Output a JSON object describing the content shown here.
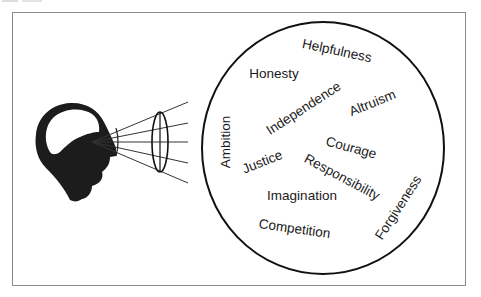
{
  "figure": {
    "colors": {
      "frame": "#8a8a8a",
      "ink": "#111111",
      "head_fill": "#1c1c1c",
      "text": "#1a1a1a"
    },
    "head": {
      "label": "head-silhouette",
      "eye_point": [
        92,
        142
      ]
    },
    "lens": {
      "center": [
        160,
        142
      ],
      "rx": 8,
      "ry": 30
    },
    "rays": [
      {
        "end": [
          188,
          102
        ]
      },
      {
        "end": [
          188,
          123
        ]
      },
      {
        "end": [
          188,
          142
        ]
      },
      {
        "end": [
          188,
          163
        ]
      },
      {
        "end": [
          188,
          183
        ]
      }
    ],
    "circle": {
      "center": [
        323,
        148
      ],
      "rx": 121,
      "ry": 126
    },
    "values": [
      {
        "label": "Helpfulness",
        "x": 336,
        "y": 55,
        "rotate": 12
      },
      {
        "label": "Honesty",
        "x": 274,
        "y": 78,
        "rotate": 0
      },
      {
        "label": "Independence",
        "x": 306,
        "y": 112,
        "rotate": -33
      },
      {
        "label": "Altruism",
        "x": 374,
        "y": 107,
        "rotate": -22
      },
      {
        "label": "Ambition",
        "x": 230,
        "y": 142,
        "rotate": -90
      },
      {
        "label": "Courage",
        "x": 350,
        "y": 152,
        "rotate": 15
      },
      {
        "label": "Justice",
        "x": 264,
        "y": 166,
        "rotate": -22
      },
      {
        "label": "Responsibility",
        "x": 340,
        "y": 181,
        "rotate": 28
      },
      {
        "label": "Imagination",
        "x": 302,
        "y": 200,
        "rotate": 0
      },
      {
        "label": "Competition",
        "x": 294,
        "y": 233,
        "rotate": 8
      },
      {
        "label": "Forgiveness",
        "x": 402,
        "y": 210,
        "rotate": -57
      }
    ]
  }
}
